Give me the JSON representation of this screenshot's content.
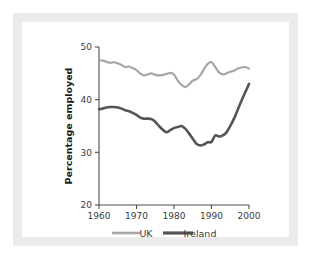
{
  "figure": {
    "background_color": "#ffffff",
    "frame_color": "#ebebeb",
    "card_color": "#ffffff"
  },
  "chart_data": {
    "type": "line",
    "title": "",
    "subtitle": "",
    "xlabel": "",
    "ylabel": "Percentage employed",
    "xlim": [
      1960,
      2000
    ],
    "ylim": [
      20,
      50
    ],
    "xticks": [
      1960,
      1970,
      1980,
      1990,
      2000
    ],
    "yticks": [
      20,
      30,
      40,
      50
    ],
    "xtick_labels": [
      "1960",
      "1970",
      "1980",
      "1990",
      "2000"
    ],
    "ytick_labels": [
      "20",
      "30",
      "40",
      "50"
    ],
    "grid": false,
    "legend_position": "bottom",
    "x": [
      1960,
      1961,
      1962,
      1963,
      1964,
      1965,
      1966,
      1967,
      1968,
      1969,
      1970,
      1971,
      1972,
      1973,
      1974,
      1975,
      1976,
      1977,
      1978,
      1979,
      1980,
      1981,
      1982,
      1983,
      1984,
      1985,
      1986,
      1987,
      1988,
      1989,
      1990,
      1991,
      1992,
      1993,
      1994,
      1995,
      1996,
      1997,
      1998,
      1999,
      2000
    ],
    "series": [
      {
        "name": "UK",
        "color": "#a6a6a6",
        "line_width": 2.2,
        "values": [
          47.5,
          47.4,
          47.2,
          47.0,
          47.1,
          46.9,
          46.6,
          46.2,
          46.3,
          46.0,
          45.6,
          45.0,
          44.6,
          44.8,
          45.0,
          44.7,
          44.6,
          44.7,
          44.9,
          45.1,
          44.8,
          43.6,
          42.8,
          42.4,
          42.9,
          43.6,
          43.9,
          44.6,
          45.8,
          46.8,
          47.1,
          46.2,
          45.2,
          44.8,
          45.0,
          45.3,
          45.5,
          45.9,
          46.1,
          46.2,
          45.9
        ]
      },
      {
        "name": "Ireland",
        "color": "#555555",
        "line_width": 2.6,
        "values": [
          38.2,
          38.3,
          38.5,
          38.6,
          38.6,
          38.5,
          38.3,
          38.0,
          37.8,
          37.5,
          37.1,
          36.6,
          36.4,
          36.4,
          36.3,
          35.8,
          35.0,
          34.3,
          33.8,
          34.2,
          34.6,
          34.8,
          35.0,
          34.5,
          33.6,
          32.6,
          31.6,
          31.3,
          31.5,
          31.9,
          32.0,
          33.2,
          33.0,
          33.2,
          33.8,
          35.0,
          36.4,
          38.1,
          39.8,
          41.4,
          43.0
        ]
      }
    ],
    "legend": [
      {
        "label": "UK",
        "color": "#a6a6a6"
      },
      {
        "label": "Ireland",
        "color": "#555555"
      }
    ]
  }
}
